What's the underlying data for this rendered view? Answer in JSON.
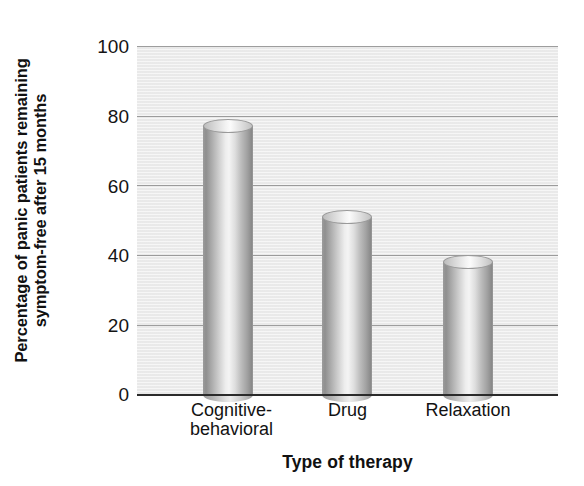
{
  "chart_data": {
    "type": "bar",
    "title": "",
    "subtitle": "",
    "categories": [
      "Cognitive-behavioral",
      "Drug",
      "Relaxation"
    ],
    "category_lines": [
      [
        "Cognitive-",
        "behavioral"
      ],
      [
        "Drug"
      ],
      [
        "Relaxation"
      ]
    ],
    "values": [
      79,
      53,
      40
    ],
    "xlabel": "Type of therapy",
    "ylabel": "Percentage of panic patients remaining symptom-free after 15 months",
    "ylabel_lines": [
      "Percentage of panic patients remaining",
      "symptom-free after 15 months"
    ],
    "ylim": [
      0,
      100
    ],
    "yticks": [
      100,
      80,
      60,
      40,
      20,
      0
    ],
    "ytick_labels": [
      "100",
      "80",
      "60",
      "40",
      "20",
      "0"
    ],
    "grid": true,
    "grid_axis": "y",
    "legend": null,
    "bar_style": "3d-cylinder",
    "colors": {
      "plot_background": "#ececec",
      "gridline": "#8d8d8d",
      "axis": "#2b2b2b",
      "bar_light": "#f4f4f4",
      "bar_dark": "#8a8a8a",
      "text": "#111111"
    }
  }
}
